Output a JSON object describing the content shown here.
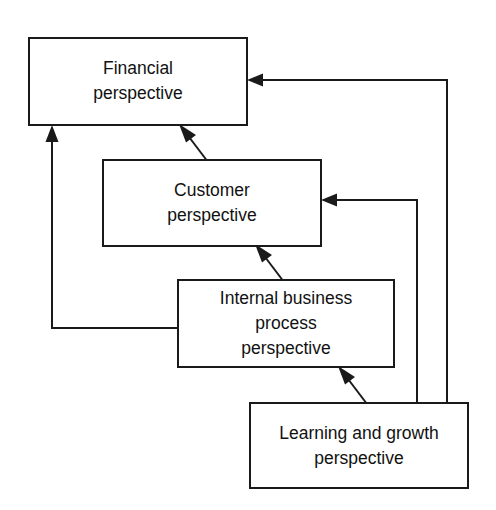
{
  "diagram": {
    "type": "flow-diagram",
    "background_color": "#ffffff",
    "line_color": "#1a1a1a",
    "text_color": "#111111",
    "nodes": [
      {
        "id": "financial",
        "name": "financial-perspective-box",
        "lines": [
          "Financial",
          "perspective"
        ],
        "line1": "Financial",
        "line2": "perspective",
        "x": 29,
        "y": 38,
        "width": 218,
        "height": 87
      },
      {
        "id": "customer",
        "name": "customer-perspective-box",
        "lines": [
          "Customer",
          "perspective"
        ],
        "line1": "Customer",
        "line2": "perspective",
        "x": 103,
        "y": 160,
        "width": 218,
        "height": 86
      },
      {
        "id": "internal",
        "name": "internal-business-process-perspective-box",
        "lines": [
          "Internal business",
          "process",
          "perspective"
        ],
        "line1": "Internal business",
        "line2": "process",
        "line3": "perspective",
        "x": 178,
        "y": 280,
        "width": 216,
        "height": 87
      },
      {
        "id": "learning",
        "name": "learning-and-growth-perspective-box",
        "lines": [
          "Learning and growth",
          "perspective"
        ],
        "line1": "Learning and growth",
        "line2": "perspective",
        "x": 250,
        "y": 403,
        "width": 218,
        "height": 85
      }
    ],
    "connectors": [
      {
        "id": "customer-to-financial",
        "name": "arrow-customer-to-financial",
        "from": "customer",
        "to": "financial",
        "style": "diagonal",
        "arrow_at": "financial-bottom"
      },
      {
        "id": "internal-to-customer",
        "name": "arrow-internal-to-customer",
        "from": "internal",
        "to": "customer",
        "style": "diagonal",
        "arrow_at": "customer-bottom"
      },
      {
        "id": "learning-to-internal",
        "name": "arrow-learning-to-internal",
        "from": "learning",
        "to": "internal",
        "style": "diagonal",
        "arrow_at": "internal-bottom"
      },
      {
        "id": "internal-to-financial",
        "name": "arrow-internal-to-financial",
        "from": "internal",
        "to": "financial",
        "style": "orthogonal-left",
        "arrow_at": "financial-bottom-left"
      },
      {
        "id": "learning-to-customer",
        "name": "arrow-learning-to-customer",
        "from": "learning",
        "to": "customer",
        "style": "orthogonal-right",
        "arrow_at": "customer-right"
      },
      {
        "id": "learning-to-financial",
        "name": "arrow-learning-to-financial",
        "from": "learning",
        "to": "financial",
        "style": "orthogonal-right-outer",
        "arrow_at": "financial-right"
      }
    ]
  }
}
